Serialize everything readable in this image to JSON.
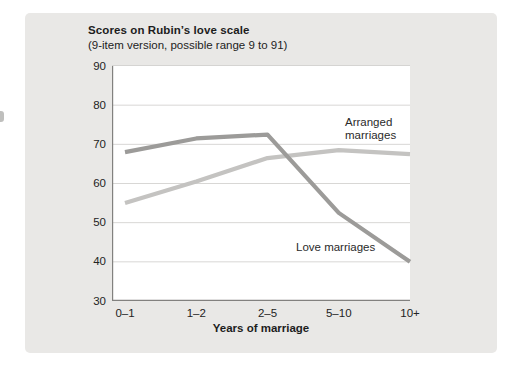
{
  "figure": {
    "title": "Scores on Rubin’s love scale",
    "subtitle": "(9-item version, possible range 9 to 91)",
    "x_axis_title": "Years of marriage"
  },
  "chart_data": {
    "type": "line",
    "title": "Scores on Rubin’s love scale",
    "subtitle": "(9-item version, possible range 9 to 91)",
    "xlabel": "Years of marriage",
    "ylabel": "Score on Rubin’s love scale",
    "categories": [
      "0–1",
      "1–2",
      "2–5",
      "5–10",
      "10+"
    ],
    "series": [
      {
        "name": "Arranged marriages",
        "values": [
          55,
          60.5,
          66.5,
          68.5,
          67.5
        ],
        "color": "#c4c3c1",
        "label_text": "Arranged\nmarriages"
      },
      {
        "name": "Love marriages",
        "values": [
          68,
          71.5,
          72.5,
          52.5,
          40
        ],
        "color": "#9c9b99",
        "label_text": "Love marriages"
      }
    ],
    "ylim": [
      30,
      90
    ],
    "yticks": [
      90,
      80,
      70,
      60,
      50,
      40,
      30
    ],
    "grid": true,
    "legend_position": "inline-annotations"
  },
  "colors": {
    "card_bg": "#e9e8e6",
    "plot_bg": "#ffffff",
    "axis": "#82817f",
    "gridline": "#d8d7d5",
    "text": "#232323"
  }
}
